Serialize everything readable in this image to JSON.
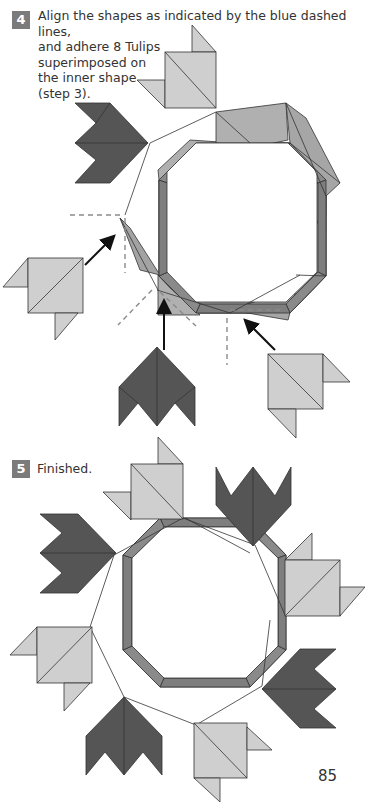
{
  "steps": [
    {
      "number": "4",
      "lines": [
        "Align the shapes as indicated by the blue dashed lines,",
        "and adhere 8 Tulips",
        "superimposed on",
        "the inner shape",
        "(step 3)."
      ]
    },
    {
      "number": "5",
      "lines": [
        "Finished."
      ]
    }
  ],
  "page_number": "85",
  "colors": {
    "badge": "#7b7b7b",
    "light_tulip": "#cfcfcf",
    "dark_tulip": "#555555",
    "ring_mid": "#a5a5a5",
    "ring_dark": "#7c7c7c",
    "dashed_line": "#8a8a8a",
    "arrow": "#111111"
  }
}
